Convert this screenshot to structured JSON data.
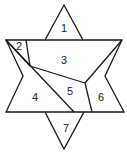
{
  "diagram": {
    "colors": {
      "line": "#1a1a1a",
      "background": "#ffffff",
      "label": "#222222"
    },
    "regions": [
      {
        "id": "1",
        "label": "1",
        "x": 63,
        "y": 31
      },
      {
        "id": "2",
        "label": "2",
        "x": 19,
        "y": 49
      },
      {
        "id": "3",
        "label": "3",
        "x": 63,
        "y": 60
      },
      {
        "id": "4",
        "label": "4",
        "x": 35,
        "y": 97
      },
      {
        "id": "5",
        "label": "5",
        "x": 70,
        "y": 92
      },
      {
        "id": "6",
        "label": "6",
        "x": 101,
        "y": 97
      },
      {
        "id": "7",
        "label": "7",
        "x": 66,
        "y": 128
      }
    ]
  }
}
